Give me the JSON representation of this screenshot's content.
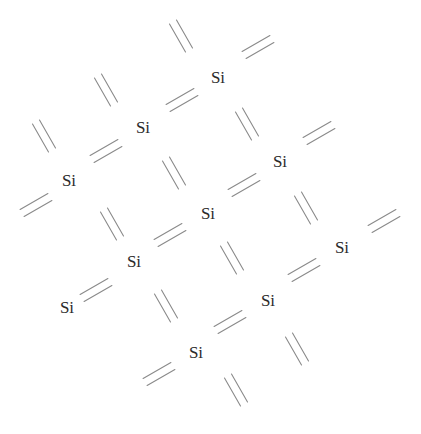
{
  "diagram": {
    "title": "",
    "colors": {
      "background": "#ffffff",
      "text": "#2a2a2a",
      "bond": "#8a8a8a"
    },
    "atoms": [
      {
        "label": "Si",
        "x": 218,
        "y": 77
      },
      {
        "label": "Si",
        "x": 143,
        "y": 127
      },
      {
        "label": "Si",
        "x": 69,
        "y": 180
      },
      {
        "label": "Si",
        "x": 280,
        "y": 161
      },
      {
        "label": "Si",
        "x": 208,
        "y": 213
      },
      {
        "label": "Si",
        "x": 134,
        "y": 261
      },
      {
        "label": "Si",
        "x": 67,
        "y": 307
      },
      {
        "label": "Si",
        "x": 342,
        "y": 247
      },
      {
        "label": "Si",
        "x": 268,
        "y": 300
      },
      {
        "label": "Si",
        "x": 196,
        "y": 352
      }
    ],
    "bonds": [
      {
        "orientation": "backslash",
        "cx": 181,
        "cy": 36
      },
      {
        "orientation": "backslash",
        "cx": 106,
        "cy": 90
      },
      {
        "orientation": "backslash",
        "cx": 44,
        "cy": 136
      },
      {
        "orientation": "backslash",
        "cx": 247,
        "cy": 124
      },
      {
        "orientation": "backslash",
        "cx": 174,
        "cy": 173
      },
      {
        "orientation": "backslash",
        "cx": 112,
        "cy": 224
      },
      {
        "orientation": "backslash",
        "cx": 306,
        "cy": 208
      },
      {
        "orientation": "backslash",
        "cx": 232,
        "cy": 258
      },
      {
        "orientation": "backslash",
        "cx": 166,
        "cy": 306
      },
      {
        "orientation": "backslash",
        "cx": 297,
        "cy": 349
      },
      {
        "orientation": "backslash",
        "cx": 236,
        "cy": 390
      },
      {
        "orientation": "slash",
        "cx": 258,
        "cy": 47
      },
      {
        "orientation": "slash",
        "cx": 182,
        "cy": 100
      },
      {
        "orientation": "slash",
        "cx": 106,
        "cy": 151
      },
      {
        "orientation": "slash",
        "cx": 36,
        "cy": 205
      },
      {
        "orientation": "slash",
        "cx": 319,
        "cy": 133
      },
      {
        "orientation": "slash",
        "cx": 244,
        "cy": 185
      },
      {
        "orientation": "slash",
        "cx": 170,
        "cy": 235
      },
      {
        "orientation": "slash",
        "cx": 96,
        "cy": 290
      },
      {
        "orientation": "slash",
        "cx": 384,
        "cy": 221
      },
      {
        "orientation": "slash",
        "cx": 304,
        "cy": 270
      },
      {
        "orientation": "slash",
        "cx": 230,
        "cy": 322
      },
      {
        "orientation": "slash",
        "cx": 159,
        "cy": 374
      }
    ]
  }
}
